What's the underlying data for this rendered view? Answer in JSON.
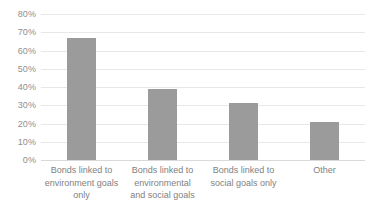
{
  "chart_data": {
    "type": "bar",
    "title": "",
    "subtitle": "",
    "xlabel": "",
    "ylabel": "",
    "categories": [
      "Bonds linked to environment goals only",
      "Bonds linked to environmental and social goals",
      "Bonds linked to social goals only",
      "Other"
    ],
    "category_lines": [
      [
        "Bonds linked to",
        "environment goals",
        "only"
      ],
      [
        "Bonds linked to",
        "environmental",
        "and social goals"
      ],
      [
        "Bonds linked to",
        "social goals only"
      ],
      [
        "Other"
      ]
    ],
    "values": [
      67,
      39,
      31,
      21
    ],
    "value_labels": [
      "67%",
      "39%",
      "31%",
      "21%"
    ],
    "ylim": [
      0,
      80
    ],
    "ytick_values": [
      80,
      70,
      60,
      50,
      40,
      30,
      20,
      10,
      0
    ],
    "ytick_labels": [
      "80%",
      "70%",
      "60%",
      "50%",
      "40%",
      "30%",
      "20%",
      "10%",
      "0%"
    ],
    "grid": true,
    "legend": false,
    "legend_position": "none",
    "series": [
      {
        "name": "Share of bonds",
        "values": [
          67,
          39,
          31,
          21
        ],
        "color": "#9b9b9b"
      }
    ],
    "colors": {
      "bar": "#9b9b9b",
      "gridline": "#e8e8e8",
      "baseline": "#d9d9d9",
      "tick_text": "#8f8f8f",
      "category_text": "#7f7f7f",
      "background": "#ffffff"
    }
  }
}
